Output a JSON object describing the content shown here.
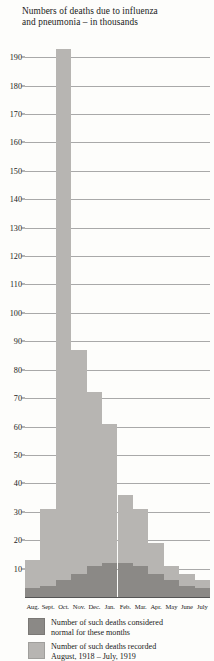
{
  "chart_data": {
    "type": "bar",
    "title": "Numbers of deaths due to influenza and pneumonia – in thousands",
    "title_line1": "Numbers of deaths due to influenza",
    "title_line2": "and pneumonia – in thousands",
    "xlabel": "",
    "ylabel": "",
    "ylim": [
      0,
      195
    ],
    "ytick_step": 10,
    "ytick_labels": [
      "190",
      "180",
      "170",
      "160",
      "150",
      "140",
      "130",
      "120",
      "110",
      "100",
      "90",
      "80",
      "70",
      "60",
      "50",
      "40",
      "30",
      "20",
      "10"
    ],
    "ytick_values": [
      190,
      180,
      170,
      160,
      150,
      140,
      130,
      120,
      110,
      100,
      90,
      80,
      70,
      60,
      50,
      40,
      30,
      20,
      10
    ],
    "grid": true,
    "grid_axis": "y",
    "legend_position": "bottom",
    "categories": [
      "Aug.",
      "Sept.",
      "Oct.",
      "Nov.",
      "Dec.",
      "Jan.",
      "Feb.",
      "Mar.",
      "Apr.",
      "May",
      "June",
      "July"
    ],
    "series": [
      {
        "name": "Number of such deaths recorded August, 1918 – July, 1919",
        "key": "recorded",
        "color": "#b7b5b2",
        "values": [
          13,
          31,
          193,
          87,
          72,
          61,
          36,
          31,
          19,
          11,
          8,
          6
        ]
      },
      {
        "name": "Number of such deaths considered normal for these months",
        "key": "normal",
        "color": "#8b8986",
        "values": [
          3,
          4,
          6,
          8,
          11,
          12,
          12,
          11,
          8,
          6,
          4,
          3
        ]
      }
    ]
  },
  "legend": [
    {
      "swatch": "dark",
      "line1": "Number of such deaths considered",
      "line2": "normal for these months"
    },
    {
      "swatch": "light",
      "line1": "Number of such deaths recorded",
      "line2": "August, 1918 – July, 1919"
    }
  ]
}
